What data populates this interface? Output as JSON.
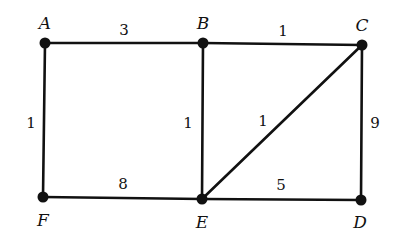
{
  "graph": {
    "type": "weighted-undirected-graph",
    "nodes": [
      {
        "id": "A",
        "label": "A",
        "x": 45,
        "y": 43,
        "lx": 45,
        "ly": 24
      },
      {
        "id": "B",
        "label": "B",
        "x": 203,
        "y": 43,
        "lx": 203,
        "ly": 24
      },
      {
        "id": "C",
        "label": "C",
        "x": 362,
        "y": 45,
        "lx": 362,
        "ly": 26
      },
      {
        "id": "D",
        "label": "D",
        "x": 361,
        "y": 200,
        "lx": 360,
        "ly": 223
      },
      {
        "id": "E",
        "label": "E",
        "x": 202,
        "y": 199,
        "lx": 202,
        "ly": 223
      },
      {
        "id": "F",
        "label": "F",
        "x": 43,
        "y": 197,
        "lx": 43,
        "ly": 221
      }
    ],
    "edges": [
      {
        "from": "A",
        "to": "B",
        "weight": "3",
        "wx": 124,
        "wy": 35
      },
      {
        "from": "B",
        "to": "C",
        "weight": "1",
        "wx": 283,
        "wy": 36
      },
      {
        "from": "A",
        "to": "F",
        "weight": "1",
        "wx": 31,
        "wy": 128
      },
      {
        "from": "B",
        "to": "E",
        "weight": "1",
        "wx": 188,
        "wy": 128
      },
      {
        "from": "C",
        "to": "E",
        "weight": "1",
        "wx": 263,
        "wy": 126
      },
      {
        "from": "C",
        "to": "D",
        "weight": "9",
        "wx": 375,
        "wy": 128
      },
      {
        "from": "F",
        "to": "E",
        "weight": "8",
        "wx": 123,
        "wy": 189
      },
      {
        "from": "E",
        "to": "D",
        "weight": "5",
        "wx": 281,
        "wy": 190
      }
    ]
  }
}
